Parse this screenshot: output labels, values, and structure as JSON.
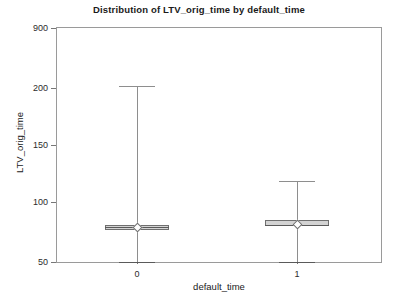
{
  "chart_data": {
    "type": "box",
    "title": "Distribution of LTV_orig_time by default_time",
    "xlabel": "default_time",
    "ylabel": "LTV_orig_time",
    "grid": false,
    "legend": "none",
    "categories": [
      "0",
      "1"
    ],
    "y_tick_labels": [
      "900",
      "200",
      "150",
      "100",
      "50"
    ],
    "y_tick_values": [
      900,
      200,
      150,
      100,
      50
    ],
    "y_tick_pixel_y": [
      28,
      88,
      145,
      202,
      262
    ],
    "x_tick_labels": [
      "0",
      "1"
    ],
    "boxes": [
      {
        "category": "0",
        "whisker_high": 218,
        "q3": 81,
        "median": 79,
        "mean": 79,
        "q1": 77,
        "whisker_low": 50
      },
      {
        "category": "1",
        "whisker_high": 118,
        "q3": 85,
        "median": 81,
        "mean": 81,
        "q1": 80,
        "whisker_low": 50
      }
    ]
  },
  "colors": {
    "box_fill": "#d3d3d3",
    "box_border": "#6f6f6f",
    "whisker": "#8e8e8e",
    "frame": "#9a9a9a",
    "text": "#1a1a1a",
    "background": "#ffffff"
  }
}
